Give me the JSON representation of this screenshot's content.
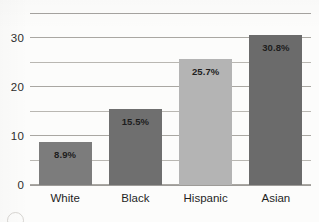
{
  "chart_data": {
    "type": "bar",
    "title": "",
    "subtitle": "",
    "xlabel": "",
    "ylabel": "",
    "categories": [
      "White",
      "Black",
      "Hispanic",
      "Asian"
    ],
    "values": [
      8.9,
      15.5,
      25.7,
      30.8
    ],
    "data_labels": [
      "8.9%",
      "15.5%",
      "25.7%",
      "30.8%"
    ],
    "bar_colors": [
      "#7c7c7c",
      "#6f6f6f",
      "#b4b4b4",
      "#6b6b6b"
    ],
    "ylim": [
      0,
      35
    ],
    "yticks": [
      0,
      10,
      20,
      30
    ],
    "ytick_labels": [
      "0",
      "10",
      "20",
      "30"
    ],
    "gridlines": [
      0,
      5,
      10,
      15,
      20,
      25,
      30,
      35
    ],
    "grid": true,
    "legend": "none",
    "series": [
      {
        "name": "",
        "values": [
          8.9,
          15.5,
          25.7,
          30.8
        ]
      }
    ]
  },
  "colors": {
    "background": "#fcfcfb",
    "gridline": "#b9b7b2",
    "axis_text": "#2c2c2c",
    "label_text": "#1d1d1d"
  },
  "marks": {
    "corner_mark": "circle-mark"
  }
}
